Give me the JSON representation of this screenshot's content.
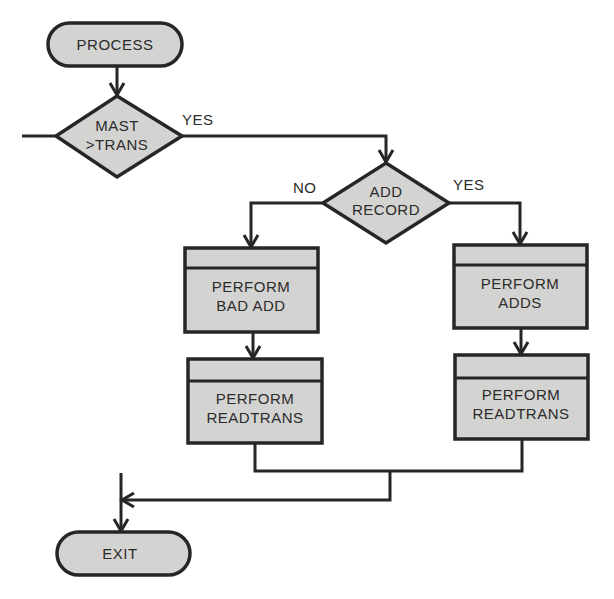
{
  "diagram": {
    "type": "flowchart",
    "nodes": {
      "start": {
        "kind": "terminal",
        "label": "PROCESS"
      },
      "decision1": {
        "kind": "decision",
        "line1": "MAST",
        "line2": ">TRANS"
      },
      "decision2": {
        "kind": "decision",
        "line1": "ADD",
        "line2": "RECORD"
      },
      "box_bad_add": {
        "kind": "predefined-process",
        "line1": "PERFORM",
        "line2": "BAD ADD"
      },
      "box_readtrans_left": {
        "kind": "predefined-process",
        "line1": "PERFORM",
        "line2": "READTRANS"
      },
      "box_adds": {
        "kind": "predefined-process",
        "line1": "PERFORM",
        "line2": "ADDS"
      },
      "box_readtrans_right": {
        "kind": "predefined-process",
        "line1": "PERFORM",
        "line2": "READTRANS"
      },
      "end": {
        "kind": "terminal",
        "label": "EXIT"
      }
    },
    "edge_labels": {
      "d1_yes": "YES",
      "d2_no": "NO",
      "d2_yes": "YES"
    },
    "edges": [
      {
        "from": "start",
        "to": "decision1"
      },
      {
        "from": "decision1",
        "to": "decision2",
        "label": "YES"
      },
      {
        "from": "decision2",
        "to": "box_bad_add",
        "label": "NO"
      },
      {
        "from": "decision2",
        "to": "box_adds",
        "label": "YES"
      },
      {
        "from": "box_bad_add",
        "to": "box_readtrans_left"
      },
      {
        "from": "box_adds",
        "to": "box_readtrans_right"
      },
      {
        "from": "box_readtrans_left",
        "to": "end"
      },
      {
        "from": "box_readtrans_right",
        "to": "end"
      }
    ],
    "colors": {
      "fill": "#d3d3d1",
      "stroke": "#262626",
      "background": "#ffffff"
    }
  }
}
